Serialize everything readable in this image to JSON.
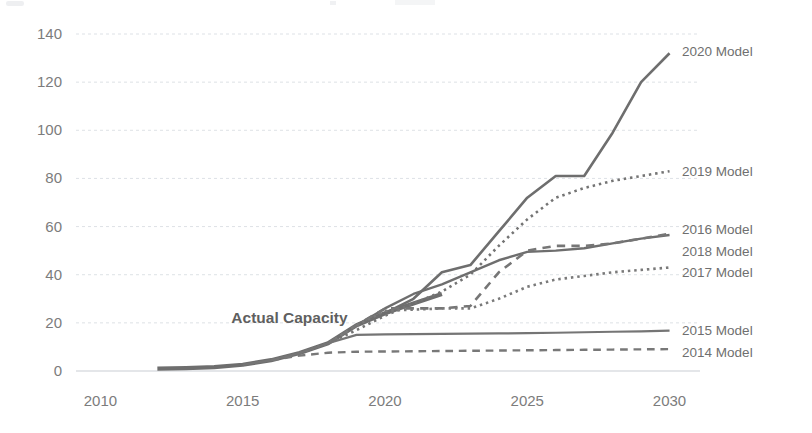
{
  "chart_data": {
    "type": "line",
    "title": "",
    "xlabel": "",
    "ylabel": "",
    "xlim": [
      2009,
      2031
    ],
    "ylim": [
      0,
      148
    ],
    "xticks": [
      "2010",
      "2015",
      "2020",
      "2025",
      "2030"
    ],
    "yticks": [
      "0",
      "20",
      "40",
      "60",
      "80",
      "100",
      "120",
      "140"
    ],
    "grid": true,
    "legend_position": "right-inline-labels",
    "annotations": [
      {
        "text": "Actual Capacity",
        "x": 2014.6,
        "y": 22,
        "bold": true
      }
    ],
    "series": [
      {
        "name": "Actual Capacity",
        "label": "Actual Capacity",
        "style": "solid",
        "width": 4.2,
        "color": "#6e6e6e",
        "x": [
          2012,
          2013,
          2014,
          2015,
          2016,
          2017,
          2018,
          2019,
          2020,
          2021,
          2022
        ],
        "values": [
          1,
          1.2,
          1.6,
          2.6,
          4.5,
          7.5,
          11.5,
          19,
          24,
          28,
          32
        ]
      },
      {
        "name": "2020 Model",
        "label": "2020 Model",
        "style": "solid",
        "width": 2.6,
        "color": "#6e6e6e",
        "label_x": 2030.3,
        "label_y": 133,
        "x": [
          2019,
          2020,
          2021,
          2022,
          2023,
          2024,
          2025,
          2026,
          2027,
          2028,
          2029,
          2030
        ],
        "values": [
          19,
          24,
          30,
          41,
          44,
          58,
          72,
          81,
          81,
          99,
          120,
          132
        ]
      },
      {
        "name": "2019 Model",
        "label": "2019 Model",
        "style": "dotted",
        "width": 2.6,
        "color": "#747474",
        "label_x": 2030.3,
        "label_y": 83,
        "x": [
          2018,
          2019,
          2020,
          2021,
          2022,
          2023,
          2024,
          2025,
          2026,
          2027,
          2028,
          2029,
          2030
        ],
        "values": [
          11.5,
          17,
          23,
          28,
          33,
          40,
          52,
          63,
          72,
          76,
          79,
          81,
          83
        ]
      },
      {
        "name": "2016 Model",
        "label": "2016 Model",
        "style": "solid",
        "width": 2.4,
        "color": "#6e6e6e",
        "label_x": 2030.3,
        "label_y": 59,
        "x": [
          2016,
          2017,
          2018,
          2019,
          2020,
          2021,
          2022,
          2023,
          2024,
          2025,
          2026,
          2027,
          2028,
          2029,
          2030
        ],
        "values": [
          4.5,
          7.5,
          11.5,
          19,
          26,
          32,
          36,
          41,
          46,
          49.5,
          50,
          51,
          53,
          55,
          56.5
        ]
      },
      {
        "name": "2018 Model",
        "label": "2018 Model",
        "style": "dashed",
        "width": 2.6,
        "color": "#767676",
        "label_x": 2030.3,
        "label_y": 50,
        "x": [
          2018,
          2019,
          2020,
          2021,
          2022,
          2023,
          2024,
          2025,
          2026,
          2027,
          2028,
          2029,
          2030
        ],
        "values": [
          11.5,
          19,
          26,
          26,
          26,
          27,
          41,
          50,
          52,
          52,
          53,
          55,
          57
        ]
      },
      {
        "name": "2017 Model",
        "label": "2017 Model",
        "style": "dotted",
        "width": 2.6,
        "color": "#7a7a7a",
        "label_x": 2030.3,
        "label_y": 41,
        "x": [
          2017,
          2018,
          2019,
          2020,
          2021,
          2022,
          2023,
          2024,
          2025,
          2026,
          2027,
          2028,
          2029,
          2030
        ],
        "values": [
          7.5,
          11.5,
          19,
          25,
          25.5,
          26,
          26,
          30,
          35,
          38,
          39.5,
          41,
          42,
          43
        ]
      },
      {
        "name": "2015 Model",
        "label": "2015 Model",
        "style": "solid",
        "width": 2.2,
        "color": "#757575",
        "label_x": 2030.3,
        "label_y": 17,
        "x": [
          2015,
          2016,
          2017,
          2018,
          2019,
          2020,
          2021,
          2022,
          2023,
          2024,
          2025,
          2026,
          2027,
          2028,
          2029,
          2030
        ],
        "values": [
          2.6,
          4.5,
          7.5,
          11.5,
          15,
          15.2,
          15.3,
          15.4,
          15.5,
          15.6,
          15.7,
          15.9,
          16.1,
          16.3,
          16.5,
          16.8
        ]
      },
      {
        "name": "2014 Model",
        "label": "2014 Model",
        "style": "dashed",
        "width": 2.4,
        "color": "#787878",
        "label_x": 2030.3,
        "label_y": 8,
        "x": [
          2016,
          2017,
          2018,
          2019,
          2020,
          2021,
          2022,
          2023,
          2024,
          2025,
          2026,
          2027,
          2028,
          2029,
          2030
        ],
        "values": [
          4.5,
          6.4,
          7.6,
          8.0,
          8.1,
          8.2,
          8.3,
          8.4,
          8.5,
          8.6,
          8.7,
          8.8,
          8.9,
          9.0,
          9.1
        ]
      }
    ]
  }
}
